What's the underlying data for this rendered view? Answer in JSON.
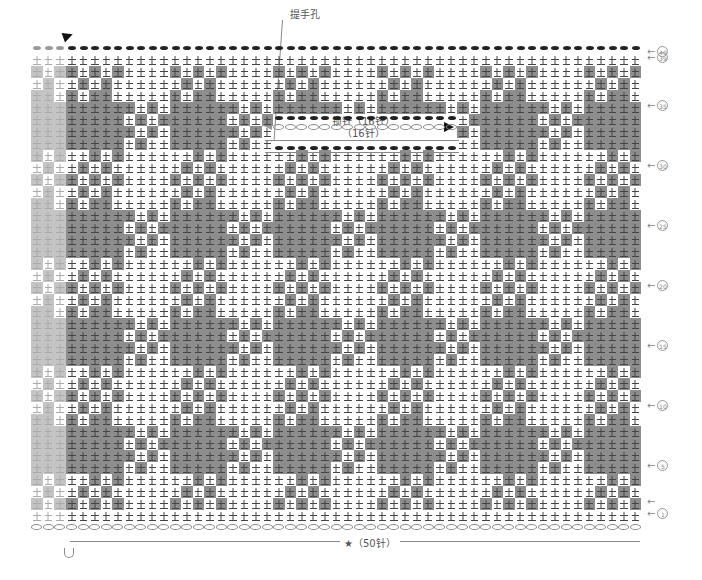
{
  "chart": {
    "title_label": "提手孔",
    "chain_label": "锁针（16针）",
    "gap_label": "（16针）",
    "bottom_label": "★（50针）",
    "grid": {
      "cols": 50,
      "rows": 39,
      "left": 66,
      "top": 54,
      "cell_w": 11.5,
      "cell_h": 12
    },
    "left_strip": {
      "cols": 3,
      "left": 31
    },
    "tile_period": {
      "cols": 9,
      "rows": 9
    },
    "tile": [
      [
        1,
        0,
        1,
        0,
        1,
        0,
        0,
        0,
        0
      ],
      [
        0,
        1,
        0,
        1,
        0,
        0,
        0,
        0,
        0
      ],
      [
        1,
        0,
        1,
        1,
        0,
        0,
        0,
        0,
        0
      ],
      [
        1,
        1,
        1,
        1,
        1,
        1,
        0,
        1,
        0
      ],
      [
        1,
        1,
        1,
        1,
        1,
        0,
        1,
        0,
        1
      ],
      [
        1,
        1,
        1,
        1,
        1,
        1,
        0,
        1,
        0
      ],
      [
        1,
        1,
        1,
        1,
        1,
        0,
        1,
        0,
        0
      ],
      [
        0,
        0,
        1,
        0,
        1,
        0,
        0,
        0,
        0
      ],
      [
        0,
        1,
        0,
        1,
        0,
        0,
        0,
        0,
        0
      ]
    ],
    "handle_hole": {
      "start_col": 18,
      "end_col": 34,
      "top_row": 5,
      "bottom_row": 8
    },
    "row_labels": [
      {
        "text": "40",
        "row": 0
      },
      {
        "text": "39",
        "row": 1
      },
      {
        "text": "35",
        "row": 5
      },
      {
        "text": "30",
        "row": 10
      },
      {
        "text": "25",
        "row": 15
      },
      {
        "text": "20",
        "row": 20
      },
      {
        "text": "15",
        "row": 25
      },
      {
        "text": "10",
        "row": 30
      },
      {
        "text": "5",
        "row": 35
      },
      {
        "text": "",
        "row": 38
      },
      {
        "text": "1",
        "row": 39
      }
    ],
    "colors": {
      "fill": "#8d8d8d",
      "faded_fill": "#c4c4c4",
      "chain": "#222222"
    }
  }
}
